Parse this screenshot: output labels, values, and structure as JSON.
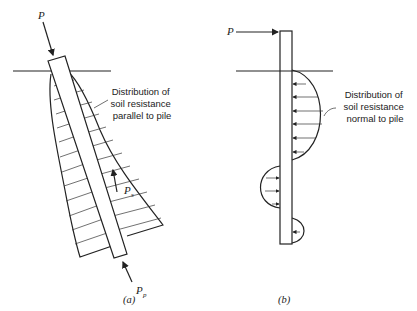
{
  "figure_a": {
    "load_label": "P",
    "note_lines": [
      "Distribution of",
      "soil resistance",
      "parallel to pile"
    ],
    "skin_label": "P",
    "skin_sub": "s",
    "tip_label": "P",
    "tip_sub": "p",
    "caption": "(a)"
  },
  "figure_b": {
    "load_label": "P",
    "note_lines": [
      "Distribution of",
      "soil resistance",
      "normal to pile"
    ],
    "caption": "(b)"
  },
  "colors": {
    "ink": "#222222",
    "background": "#ffffff"
  }
}
